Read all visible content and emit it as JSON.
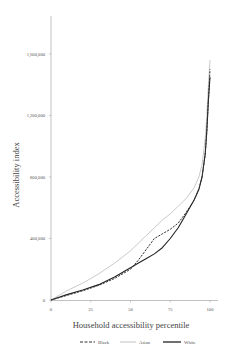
{
  "chart_data": {
    "type": "line",
    "title": "",
    "xlabel": "Household accessibility percentile",
    "ylabel": "Accessibility index",
    "xlim": [
      0,
      100
    ],
    "ylim": [
      0,
      1700000
    ],
    "x_ticks": [
      0,
      25,
      50,
      75,
      100
    ],
    "x_tick_labels": [
      "0",
      "25",
      "50",
      "75",
      "100"
    ],
    "y_ticks": [
      0,
      400000,
      800000,
      1200000,
      1600000
    ],
    "y_tick_labels": [
      "0",
      "400,000",
      "800,000",
      "1,200,000",
      "1,600,000"
    ],
    "grid": false,
    "legend_position": "bottom",
    "x": [
      0,
      10,
      20,
      30,
      40,
      50,
      55,
      60,
      65,
      70,
      75,
      80,
      85,
      90,
      93,
      95,
      97,
      98,
      99,
      100
    ],
    "series": [
      {
        "name": "Black",
        "style": "dashed",
        "color": "#333333",
        "values": [
          0,
          30000,
          60000,
          95000,
          140000,
          200000,
          260000,
          330000,
          400000,
          430000,
          460000,
          500000,
          570000,
          650000,
          720000,
          800000,
          950000,
          1100000,
          1300000,
          1500000
        ]
      },
      {
        "name": "Asian",
        "style": "solid",
        "color": "#bbbbbb",
        "values": [
          0,
          60000,
          110000,
          170000,
          240000,
          320000,
          370000,
          420000,
          470000,
          520000,
          560000,
          610000,
          660000,
          730000,
          800000,
          880000,
          1050000,
          1200000,
          1400000,
          1560000
        ]
      },
      {
        "name": "White",
        "style": "solid",
        "color": "#222222",
        "values": [
          0,
          35000,
          65000,
          100000,
          150000,
          210000,
          240000,
          270000,
          300000,
          340000,
          400000,
          470000,
          560000,
          650000,
          720000,
          800000,
          950000,
          1100000,
          1300000,
          1450000
        ]
      }
    ]
  },
  "legend": [
    {
      "label": "Black"
    },
    {
      "label": "Asian"
    },
    {
      "label": "White"
    }
  ]
}
